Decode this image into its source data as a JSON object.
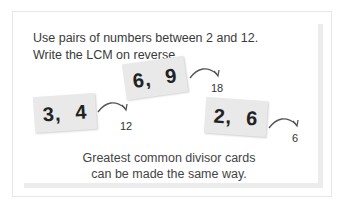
{
  "instructions": {
    "line1": "Use pairs of numbers  between 2 and 12.",
    "line2": "Write the LCM on reverse."
  },
  "cards": [
    {
      "a": "3,",
      "b": "4",
      "result": "12"
    },
    {
      "a": "6,",
      "b": "9",
      "result": "18"
    },
    {
      "a": "2,",
      "b": "6",
      "result": "6"
    }
  ],
  "footer": {
    "line1": "Greatest common divisor cards",
    "line2": "can be made the same way."
  },
  "colors": {
    "card": "#e9e9e9",
    "text": "#333333",
    "border": "#e6e6e6"
  }
}
